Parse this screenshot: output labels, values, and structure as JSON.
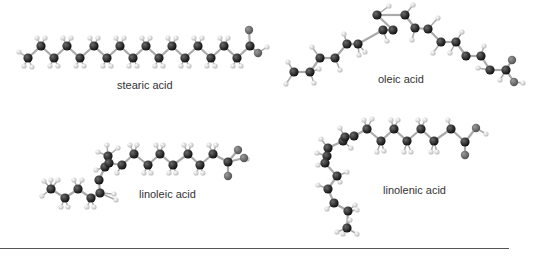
{
  "figure": {
    "colors": {
      "carbon": "#1a1a1a",
      "hydrogen": "#d9d9d9",
      "oxygen": "#6e6e6e",
      "bond": "#aaaaaa",
      "label": "#333333",
      "rule": "#555555"
    },
    "molecules": [
      {
        "id": "stearic",
        "label": "stearic acid",
        "label_pos": [
          117,
          79
        ],
        "carbons": [
          [
            28,
            58
          ],
          [
            41,
            46
          ],
          [
            54,
            58
          ],
          [
            67,
            46
          ],
          [
            80,
            58
          ],
          [
            94,
            46
          ],
          [
            107,
            58
          ],
          [
            120,
            46
          ],
          [
            133,
            58
          ],
          [
            146,
            46
          ],
          [
            159,
            58
          ],
          [
            172,
            46
          ],
          [
            185,
            58
          ],
          [
            198,
            46
          ],
          [
            211,
            58
          ],
          [
            224,
            46
          ],
          [
            237,
            58
          ],
          [
            250,
            46
          ]
        ],
        "oxygens": [
          [
            249,
            30
          ],
          [
            258,
            53
          ]
        ],
        "hydrogens": [
          [
            19,
            52
          ],
          [
            24,
            66
          ],
          [
            32,
            67
          ],
          [
            37,
            38
          ],
          [
            45,
            38
          ],
          [
            50,
            66
          ],
          [
            58,
            66
          ],
          [
            63,
            38
          ],
          [
            71,
            38
          ],
          [
            76,
            66
          ],
          [
            84,
            66
          ],
          [
            90,
            38
          ],
          [
            98,
            38
          ],
          [
            103,
            66
          ],
          [
            111,
            66
          ],
          [
            116,
            38
          ],
          [
            124,
            38
          ],
          [
            129,
            66
          ],
          [
            137,
            66
          ],
          [
            142,
            38
          ],
          [
            150,
            38
          ],
          [
            155,
            66
          ],
          [
            163,
            66
          ],
          [
            168,
            38
          ],
          [
            176,
            38
          ],
          [
            181,
            66
          ],
          [
            189,
            66
          ],
          [
            194,
            38
          ],
          [
            202,
            38
          ],
          [
            207,
            66
          ],
          [
            215,
            66
          ],
          [
            220,
            38
          ],
          [
            228,
            38
          ],
          [
            233,
            66
          ],
          [
            241,
            66
          ],
          [
            267,
            47
          ]
        ]
      },
      {
        "id": "oleic",
        "label": "oleic acid",
        "label_pos": [
          378,
          73
        ],
        "carbons": [
          [
            294,
            72
          ],
          [
            310,
            72
          ],
          [
            320,
            58
          ],
          [
            335,
            58
          ],
          [
            347,
            44
          ],
          [
            358,
            44
          ],
          [
            383,
            30
          ],
          [
            393,
            30
          ],
          [
            377,
            15
          ],
          [
            405,
            15
          ],
          [
            415,
            28
          ],
          [
            428,
            29
          ],
          [
            441,
            42
          ],
          [
            456,
            42
          ],
          [
            466,
            56
          ],
          [
            481,
            56
          ],
          [
            490,
            70
          ],
          [
            506,
            70
          ]
        ],
        "oxygens": [
          [
            512,
            60
          ],
          [
            514,
            82
          ]
        ],
        "hydrogens": [
          [
            288,
            62
          ],
          [
            286,
            84
          ],
          [
            314,
            83
          ],
          [
            312,
            47
          ],
          [
            319,
            69
          ],
          [
            340,
            70
          ],
          [
            344,
            34
          ],
          [
            359,
            55
          ],
          [
            365,
            52
          ],
          [
            387,
            41
          ],
          [
            389,
            6
          ],
          [
            413,
            5
          ],
          [
            412,
            40
          ],
          [
            438,
            18
          ],
          [
            450,
            53
          ],
          [
            433,
            53
          ],
          [
            462,
            32
          ],
          [
            478,
            68
          ],
          [
            484,
            46
          ],
          [
            500,
            80
          ],
          [
            523,
            83
          ]
        ]
      },
      {
        "id": "linoleic",
        "label": "linoleic acid",
        "label_pos": [
          139,
          188
        ],
        "carbons": [
          [
            51,
            189
          ],
          [
            65,
            198
          ],
          [
            78,
            189
          ],
          [
            91,
            198
          ],
          [
            100,
            193
          ],
          [
            99,
            180
          ],
          [
            105,
            167
          ],
          [
            108,
            156
          ],
          [
            109,
            163
          ],
          [
            122,
            165
          ],
          [
            134,
            154
          ],
          [
            148,
            165
          ],
          [
            160,
            154
          ],
          [
            173,
            165
          ],
          [
            188,
            154
          ],
          [
            200,
            165
          ],
          [
            213,
            154
          ],
          [
            228,
            162
          ]
        ],
        "oxygens": [
          [
            228,
            176
          ],
          [
            238,
            150
          ],
          [
            244,
            158
          ]
        ],
        "hydrogens": [
          [
            44,
            181
          ],
          [
            51,
            180
          ],
          [
            58,
            180
          ],
          [
            42,
            196
          ],
          [
            61,
            207
          ],
          [
            68,
            207
          ],
          [
            74,
            180
          ],
          [
            82,
            180
          ],
          [
            87,
            207
          ],
          [
            94,
            207
          ],
          [
            98,
            152
          ],
          [
            107,
            145
          ],
          [
            118,
            148
          ],
          [
            117,
            173
          ],
          [
            130,
            145
          ],
          [
            137,
            145
          ],
          [
            144,
            173
          ],
          [
            151,
            173
          ],
          [
            156,
            145
          ],
          [
            163,
            145
          ],
          [
            169,
            173
          ],
          [
            176,
            173
          ],
          [
            184,
            145
          ],
          [
            191,
            145
          ],
          [
            196,
            173
          ],
          [
            203,
            173
          ],
          [
            209,
            145
          ],
          [
            216,
            145
          ],
          [
            247,
            159
          ],
          [
            114,
            194
          ],
          [
            116,
            200
          ],
          [
            96,
            170
          ]
        ],
        "hide_o_extra": true
      },
      {
        "id": "linolenic",
        "label": "linolenic acid",
        "label_pos": [
          383,
          184
        ],
        "carbons": [
          [
            328,
            148
          ],
          [
            343,
            141
          ],
          [
            345,
            137
          ],
          [
            354,
            136
          ],
          [
            367,
            129
          ],
          [
            381,
            141
          ],
          [
            394,
            129
          ],
          [
            407,
            141
          ],
          [
            421,
            129
          ],
          [
            434,
            141
          ],
          [
            451,
            129
          ],
          [
            465,
            142
          ]
        ],
        "oxygens": [
          [
            465,
            155
          ],
          [
            476,
            128
          ]
        ],
        "hydrogens": [
          [
            321,
            139
          ],
          [
            340,
            128
          ],
          [
            351,
            148
          ],
          [
            364,
            120
          ],
          [
            372,
            119
          ],
          [
            377,
            152
          ],
          [
            384,
            151
          ],
          [
            391,
            120
          ],
          [
            398,
            120
          ],
          [
            404,
            152
          ],
          [
            411,
            152
          ],
          [
            418,
            120
          ],
          [
            425,
            120
          ],
          [
            431,
            152
          ],
          [
            437,
            152
          ],
          [
            448,
            120
          ],
          [
            486,
            134
          ]
        ],
        "tail_carbons": [
          [
            327,
            156
          ],
          [
            325,
            163
          ],
          [
            337,
            176
          ],
          [
            328,
            189
          ],
          [
            334,
            203
          ],
          [
            348,
            211
          ],
          [
            347,
            228
          ]
        ],
        "tail_hydrogens": [
          [
            317,
            153
          ],
          [
            318,
            165
          ],
          [
            347,
            172
          ],
          [
            340,
            182
          ],
          [
            318,
            185
          ],
          [
            327,
            209
          ],
          [
            355,
            205
          ],
          [
            357,
            210
          ],
          [
            337,
            232
          ],
          [
            343,
            234
          ],
          [
            357,
            234
          ],
          [
            350,
            220
          ]
        ]
      }
    ],
    "divider": "horizontal-rule"
  }
}
